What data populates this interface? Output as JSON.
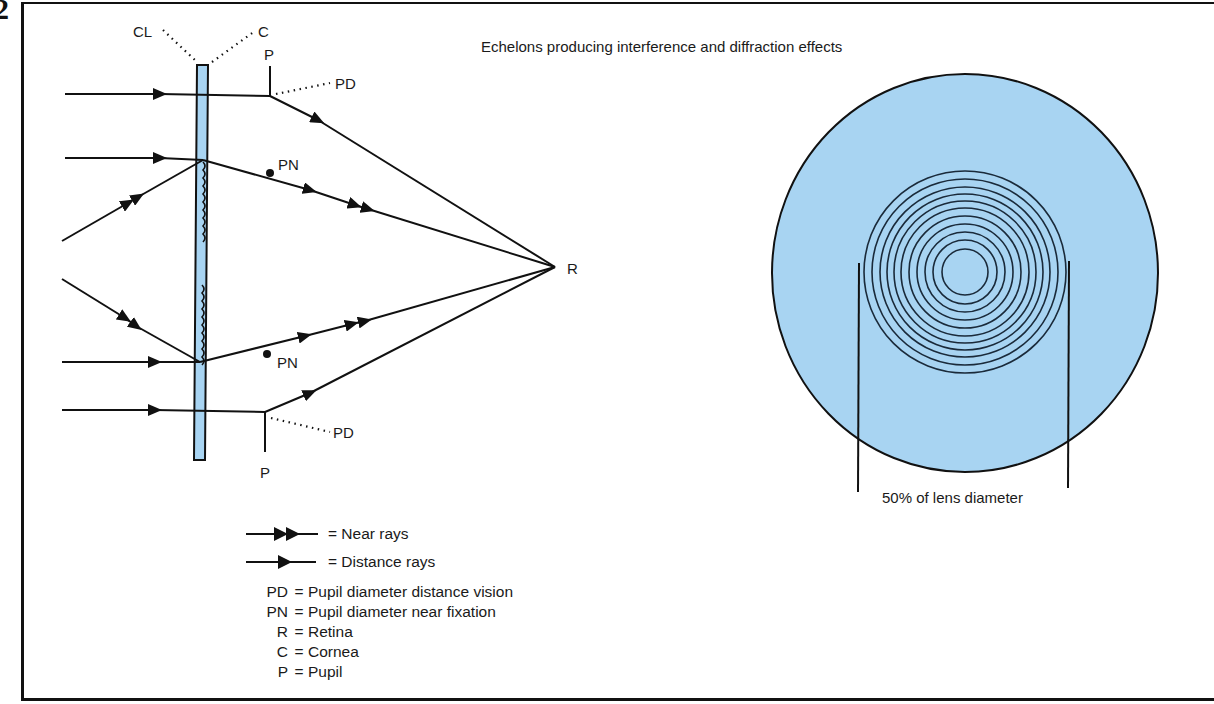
{
  "figure": {
    "number": "2",
    "title": "Echelons producing interference and diffraction effects",
    "caption": "50% of lens diameter",
    "colors": {
      "lens_blue": "#a8d4f2",
      "line": "#111111"
    }
  },
  "ray_diagram": {
    "labels": {
      "contact_lens": "CL",
      "cornea": "C",
      "pupil_top": "P",
      "pupil_bottom": "P",
      "pd_top": "PD",
      "pd_bottom": "PD",
      "pn_top": "PN",
      "pn_bottom": "PN",
      "retina": "R"
    }
  },
  "lens_face": {
    "rings_count": 11
  },
  "legend": {
    "symbols": [
      {
        "icon": "double-arrow-icon",
        "label": "= Near rays"
      },
      {
        "icon": "single-arrow-icon",
        "label": "= Distance rays"
      }
    ],
    "abbreviations": [
      {
        "key": "PD",
        "eq": "=",
        "value": "Pupil diameter distance vision"
      },
      {
        "key": "PN",
        "eq": "=",
        "value": "Pupil diameter near fixation"
      },
      {
        "key": "R",
        "eq": "=",
        "value": "Retina"
      },
      {
        "key": "C",
        "eq": "=",
        "value": "Cornea"
      },
      {
        "key": "P",
        "eq": "=",
        "value": "Pupil"
      }
    ]
  }
}
